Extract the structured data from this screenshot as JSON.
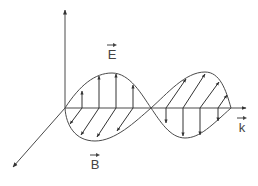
{
  "diagram": {
    "labels": {
      "E": "E",
      "B": "B",
      "k": "k"
    },
    "colors": {
      "stroke": "#4a4a4a",
      "background": "#ffffff"
    }
  }
}
